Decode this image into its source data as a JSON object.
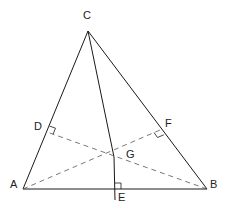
{
  "diagram": {
    "colors": {
      "line": "#1a1a1a",
      "dashed": "#555555",
      "label": "#222222",
      "background": "#ffffff"
    },
    "points": {
      "A": {
        "label": "A",
        "x": 23,
        "y": 189
      },
      "B": {
        "label": "B",
        "x": 207,
        "y": 189
      },
      "C": {
        "label": "C",
        "x": 88,
        "y": 31
      },
      "D": {
        "label": "D",
        "x": 47,
        "y": 132
      },
      "E": {
        "label": "E",
        "x": 115,
        "y": 189
      },
      "F": {
        "label": "F",
        "x": 160,
        "y": 130
      },
      "G": {
        "label": "G",
        "x": 114,
        "y": 157
      }
    },
    "segments": [
      {
        "from": "A",
        "to": "B",
        "style": "solid"
      },
      {
        "from": "B",
        "to": "C",
        "style": "solid"
      },
      {
        "from": "C",
        "to": "A",
        "style": "solid"
      },
      {
        "from": "C",
        "to": "E",
        "style": "solid",
        "note": "altitude from C, extended below AB"
      },
      {
        "from": "A",
        "to": "F",
        "style": "dashed",
        "note": "altitude from A"
      },
      {
        "from": "B",
        "to": "D",
        "style": "dashed",
        "note": "altitude from B"
      }
    ],
    "right_angle_marks": [
      "D",
      "E",
      "F"
    ]
  }
}
